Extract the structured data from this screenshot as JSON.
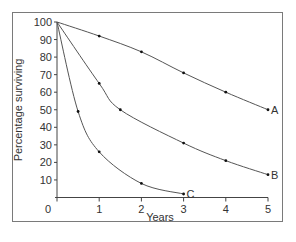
{
  "chart_data": {
    "type": "line",
    "title": "",
    "xlabel": "Years",
    "ylabel": "Percentage surviving",
    "xlim": [
      0,
      5
    ],
    "ylim": [
      0,
      100
    ],
    "x_ticks": [
      "0",
      "1",
      "2",
      "3",
      "4",
      "5"
    ],
    "y_ticks": [
      "10",
      "20",
      "30",
      "40",
      "50",
      "60",
      "70",
      "80",
      "90",
      "100"
    ],
    "grid": false,
    "legend": "inline end labels",
    "series": [
      {
        "name": "A",
        "x": [
          0,
          1,
          2,
          3,
          4,
          5
        ],
        "values": [
          100,
          92,
          83,
          71,
          60,
          50
        ]
      },
      {
        "name": "B",
        "x": [
          0,
          1,
          1.5,
          3,
          4,
          5
        ],
        "values": [
          100,
          65,
          50,
          31,
          21,
          13
        ]
      },
      {
        "name": "C",
        "x": [
          0,
          0.5,
          1,
          2,
          3
        ],
        "values": [
          100,
          49,
          26,
          8,
          2
        ]
      }
    ]
  },
  "axes": {
    "xlabel": "Years",
    "ylabel": "Percentage surviving"
  },
  "colors": {
    "line": "#555555",
    "marker": "#111111",
    "text": "#333333",
    "frame": "#7a7a7a"
  }
}
